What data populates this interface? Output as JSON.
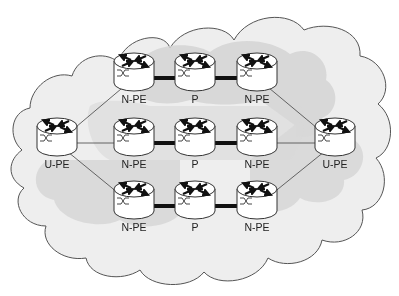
{
  "diagram": {
    "type": "network-topology",
    "colors": {
      "outer_cloud_fill": "#eeeeee",
      "outer_cloud_stroke": "#555555",
      "inner_shade": "#d6d6d6",
      "router_fill": "#ffffff",
      "router_stroke": "#333333",
      "thick_link": "#111111",
      "thin_link": "#555555"
    },
    "nodes": [
      {
        "id": "upe-left",
        "label": "U-PE",
        "x": 57,
        "y": 143
      },
      {
        "id": "npe-top-left",
        "label": "N-PE",
        "x": 134,
        "y": 78
      },
      {
        "id": "p-top",
        "label": "P",
        "x": 195,
        "y": 78
      },
      {
        "id": "npe-top-right",
        "label": "N-PE",
        "x": 257,
        "y": 78
      },
      {
        "id": "npe-mid-left",
        "label": "N-PE",
        "x": 134,
        "y": 143
      },
      {
        "id": "p-mid",
        "label": "P",
        "x": 195,
        "y": 143
      },
      {
        "id": "npe-mid-right",
        "label": "N-PE",
        "x": 257,
        "y": 143
      },
      {
        "id": "npe-bot-left",
        "label": "N-PE",
        "x": 134,
        "y": 206
      },
      {
        "id": "p-bot",
        "label": "P",
        "x": 195,
        "y": 206
      },
      {
        "id": "npe-bot-right",
        "label": "N-PE",
        "x": 257,
        "y": 206
      },
      {
        "id": "upe-right",
        "label": "U-PE",
        "x": 335,
        "y": 143
      }
    ],
    "links": [
      {
        "from": "upe-left",
        "to": "npe-top-left",
        "style": "thin"
      },
      {
        "from": "upe-left",
        "to": "npe-mid-left",
        "style": "thin"
      },
      {
        "from": "upe-left",
        "to": "npe-bot-left",
        "style": "thin"
      },
      {
        "from": "npe-top-left",
        "to": "p-top",
        "style": "thick"
      },
      {
        "from": "p-top",
        "to": "npe-top-right",
        "style": "thick"
      },
      {
        "from": "npe-mid-left",
        "to": "p-mid",
        "style": "thick"
      },
      {
        "from": "p-mid",
        "to": "npe-mid-right",
        "style": "thick"
      },
      {
        "from": "npe-bot-left",
        "to": "p-bot",
        "style": "thick"
      },
      {
        "from": "p-bot",
        "to": "npe-bot-right",
        "style": "thick"
      },
      {
        "from": "npe-top-right",
        "to": "upe-right",
        "style": "thin"
      },
      {
        "from": "npe-mid-right",
        "to": "upe-right",
        "style": "thin"
      },
      {
        "from": "npe-bot-right",
        "to": "upe-right",
        "style": "thin"
      }
    ]
  }
}
